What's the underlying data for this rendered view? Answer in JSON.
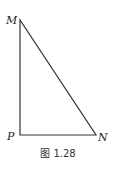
{
  "figure": {
    "caption": "图 1.28",
    "shape": "right-triangle",
    "vertices": {
      "M": {
        "label": "M",
        "x": 20,
        "y": 20
      },
      "P": {
        "label": "P",
        "x": 20,
        "y": 135
      },
      "N": {
        "label": "N",
        "x": 96,
        "y": 135
      }
    },
    "right_angle_at": "P",
    "stroke_color": "#333333"
  }
}
